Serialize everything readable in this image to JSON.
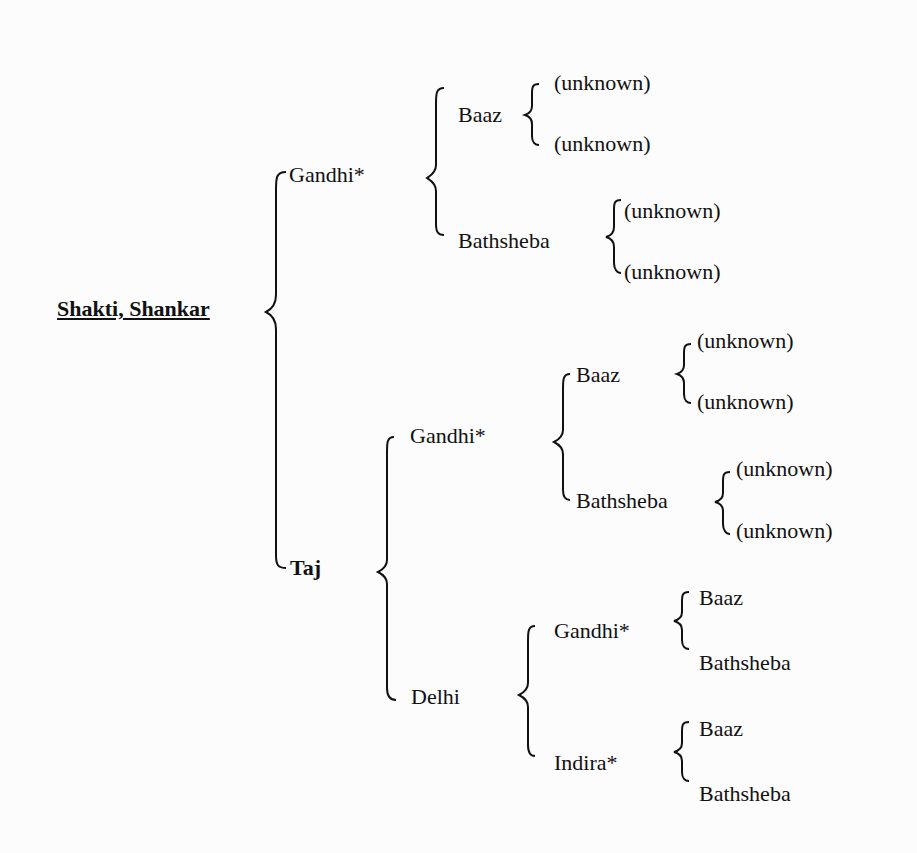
{
  "tree": {
    "root": "Shakti, Shankar",
    "sire": {
      "name": "Gandhi*",
      "sire": {
        "name": "Baaz",
        "parents": [
          "(unknown)",
          "(unknown)"
        ]
      },
      "dam": {
        "name": "Bathsheba",
        "parents": [
          "(unknown)",
          "(unknown)"
        ]
      }
    },
    "dam": {
      "name": "Taj",
      "sire": {
        "name": "Gandhi*",
        "sire": {
          "name": "Baaz",
          "parents": [
            "(unknown)",
            "(unknown)"
          ]
        },
        "dam": {
          "name": "Bathsheba",
          "parents": [
            "(unknown)",
            "(unknown)"
          ]
        }
      },
      "dam": {
        "name": "Delhi",
        "sire": {
          "name": "Gandhi*",
          "parents": [
            "Baaz",
            "Bathsheba"
          ]
        },
        "dam": {
          "name": "Indira*",
          "parents": [
            "Baaz",
            "Bathsheba"
          ]
        }
      }
    }
  }
}
